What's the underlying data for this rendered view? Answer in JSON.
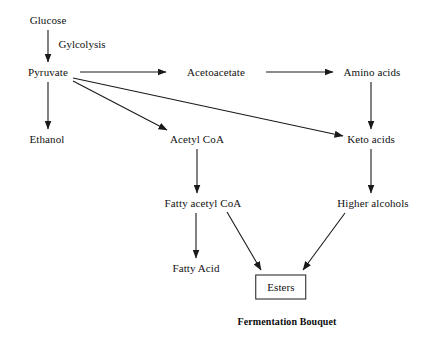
{
  "diagram": {
    "title": "Fermentation Bouquet",
    "background_color": "#ffffff",
    "line_color": "#1a1a1a",
    "text_color": "#111111",
    "nodes": [
      {
        "id": "glucose",
        "label": "Glucose",
        "x": 48,
        "y": 20,
        "boxed": false
      },
      {
        "id": "pyruvate",
        "label": "Pyruvate",
        "x": 48,
        "y": 72,
        "boxed": false
      },
      {
        "id": "ethanol",
        "label": "Ethanol",
        "x": 47,
        "y": 139,
        "boxed": false
      },
      {
        "id": "acetoacetate",
        "label": "Acetoacetate",
        "x": 216,
        "y": 72,
        "boxed": false
      },
      {
        "id": "amino-acids",
        "label": "Amino acids",
        "x": 372,
        "y": 72,
        "boxed": false
      },
      {
        "id": "acetyl-coa",
        "label": "Acetyl CoA",
        "x": 197,
        "y": 139,
        "boxed": false
      },
      {
        "id": "keto-acids",
        "label": "Keto acids",
        "x": 371,
        "y": 139,
        "boxed": false
      },
      {
        "id": "fatty-acetyl-coa",
        "label": "Fatty acetyl CoA",
        "x": 203,
        "y": 203,
        "boxed": false
      },
      {
        "id": "higher-alcohols",
        "label": "Higher alcohols",
        "x": 373,
        "y": 203,
        "boxed": false
      },
      {
        "id": "fatty-acid",
        "label": "Fatty Acid",
        "x": 196,
        "y": 268,
        "boxed": false
      },
      {
        "id": "esters",
        "label": "Esters",
        "x": 281,
        "y": 287,
        "boxed": true
      }
    ],
    "edge_labels": [
      {
        "id": "glycolysis",
        "label": "Gylcolysis",
        "x": 82,
        "y": 44
      }
    ],
    "edges": [
      {
        "id": "glucose-to-pyruvate",
        "from": "glucose",
        "to": "pyruvate",
        "x1": 48,
        "y1": 30,
        "x2": 48,
        "y2": 62
      },
      {
        "id": "pyruvate-to-ethanol",
        "from": "pyruvate",
        "to": "ethanol",
        "x1": 48,
        "y1": 82,
        "x2": 48,
        "y2": 129
      },
      {
        "id": "pyruvate-to-acetoacetate",
        "from": "pyruvate",
        "to": "acetoacetate",
        "x1": 80,
        "y1": 72,
        "x2": 166,
        "y2": 72
      },
      {
        "id": "pyruvate-to-acetyl-coa",
        "from": "pyruvate",
        "to": "acetyl-coa",
        "x1": 73,
        "y1": 81,
        "x2": 167,
        "y2": 130
      },
      {
        "id": "pyruvate-to-keto-acids",
        "from": "pyruvate",
        "to": "keto-acids",
        "x1": 73,
        "y1": 78,
        "x2": 343,
        "y2": 136
      },
      {
        "id": "acetoacetate-to-amino-acids",
        "from": "acetoacetate",
        "to": "amino-acids",
        "x1": 266,
        "y1": 72,
        "x2": 333,
        "y2": 72
      },
      {
        "id": "amino-acids-to-keto-acids",
        "from": "amino-acids",
        "to": "keto-acids",
        "x1": 371,
        "y1": 82,
        "x2": 371,
        "y2": 129
      },
      {
        "id": "keto-acids-to-higher-alcohols",
        "from": "keto-acids",
        "to": "higher-alcohols",
        "x1": 371,
        "y1": 149,
        "x2": 371,
        "y2": 193
      },
      {
        "id": "acetyl-coa-to-fatty-acetyl-coa",
        "from": "acetyl-coa",
        "to": "fatty-acetyl-coa",
        "x1": 197,
        "y1": 149,
        "x2": 197,
        "y2": 193
      },
      {
        "id": "fatty-acetyl-coa-to-fatty-acid",
        "from": "fatty-acetyl-coa",
        "to": "fatty-acid",
        "x1": 196,
        "y1": 213,
        "x2": 196,
        "y2": 258
      },
      {
        "id": "fatty-acetyl-coa-to-esters",
        "from": "fatty-acetyl-coa",
        "to": "esters",
        "x1": 227,
        "y1": 212,
        "x2": 261,
        "y2": 270
      },
      {
        "id": "higher-alcohols-to-esters",
        "from": "higher-alcohols",
        "to": "esters",
        "x1": 345,
        "y1": 213,
        "x2": 303,
        "y2": 270
      }
    ],
    "caption": {
      "label": "Fermentation Bouquet",
      "x": 287,
      "y": 321
    }
  }
}
